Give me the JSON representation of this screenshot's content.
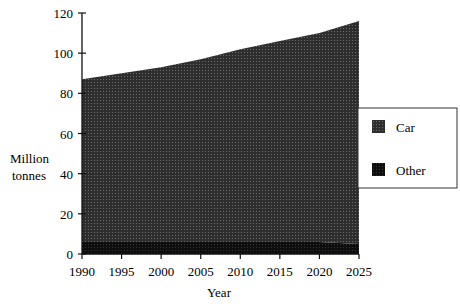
{
  "chart_data": {
    "type": "area",
    "stacked": true,
    "title": "",
    "xlabel": "Year",
    "ylabel": "Million tonnes",
    "x": [
      1990,
      1995,
      2000,
      2005,
      2010,
      2015,
      2020,
      2025
    ],
    "series": [
      {
        "name": "Other",
        "values": [
          6,
          6,
          6,
          6,
          6,
          6,
          6,
          5
        ]
      },
      {
        "name": "Car",
        "values": [
          81,
          84,
          87,
          91,
          96,
          100,
          104,
          111
        ]
      }
    ],
    "totals": [
      87,
      90,
      93,
      97,
      102,
      106,
      110,
      116
    ],
    "xlim": [
      1990,
      2025
    ],
    "ylim": [
      0,
      120
    ],
    "yticks": [
      0,
      20,
      40,
      60,
      80,
      100,
      120
    ],
    "xticks": [
      1990,
      1995,
      2000,
      2005,
      2010,
      2015,
      2020,
      2025
    ],
    "grid": false,
    "legend_position": "right",
    "legend": [
      "Car",
      "Other"
    ],
    "colors": {
      "Car": "#3a3a3a",
      "Other": "#111111"
    }
  },
  "labels": {
    "ylabel_line1": "Million",
    "ylabel_line2": "tonnes",
    "xlabel": "Year",
    "legend_car": "Car",
    "legend_other": "Other"
  }
}
